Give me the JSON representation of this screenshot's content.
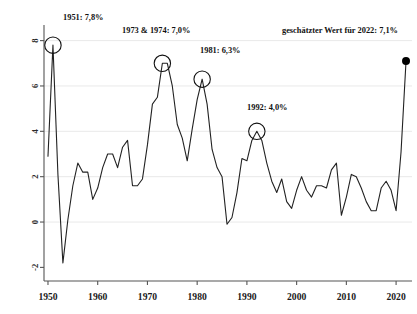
{
  "chart_data": {
    "type": "line",
    "title": "",
    "subtitle": "",
    "xlabel": "",
    "ylabel": "",
    "xlim": [
      1949.2,
      2023.2
    ],
    "ylim": [
      -2.6,
      8.6
    ],
    "xticks": [
      1950,
      1960,
      1970,
      1980,
      1990,
      2000,
      2010,
      2020
    ],
    "xtick_labels": [
      "1950",
      "1960",
      "1970",
      "1980",
      "1990",
      "2000",
      "2010",
      "2020"
    ],
    "yticks": [
      -2,
      0,
      2,
      4,
      6,
      8
    ],
    "ytick_labels": [
      "-2",
      "0",
      "2",
      "4",
      "6",
      "8"
    ],
    "grid": "horizontal",
    "legend": "none",
    "line_color": "#222222",
    "marker_color": "#000000",
    "grid_color": "#e9e9e9",
    "axis_color": "#555555",
    "series": [
      {
        "name": "Inflationsrate",
        "x": [
          1950,
          1951,
          1952,
          1953,
          1954,
          1955,
          1956,
          1957,
          1958,
          1959,
          1960,
          1961,
          1962,
          1963,
          1964,
          1965,
          1966,
          1967,
          1968,
          1969,
          1970,
          1971,
          1972,
          1973,
          1974,
          1975,
          1976,
          1977,
          1978,
          1979,
          1980,
          1981,
          1982,
          1983,
          1984,
          1985,
          1986,
          1987,
          1988,
          1989,
          1990,
          1991,
          1992,
          1993,
          1994,
          1995,
          1996,
          1997,
          1998,
          1999,
          2000,
          2001,
          2002,
          2003,
          2004,
          2005,
          2006,
          2007,
          2008,
          2009,
          2010,
          2011,
          2012,
          2013,
          2014,
          2015,
          2016,
          2017,
          2018,
          2019,
          2020,
          2021,
          2022
        ],
        "y": [
          2.9,
          7.8,
          2.1,
          -1.8,
          0.1,
          1.6,
          2.6,
          2.2,
          2.2,
          1.0,
          1.5,
          2.4,
          3.0,
          3.0,
          2.4,
          3.3,
          3.6,
          1.6,
          1.6,
          1.9,
          3.4,
          5.2,
          5.5,
          7.0,
          7.0,
          6.0,
          4.3,
          3.7,
          2.7,
          4.1,
          5.4,
          6.3,
          5.2,
          3.2,
          2.4,
          2.0,
          -0.1,
          0.2,
          1.3,
          2.8,
          2.7,
          3.6,
          4.0,
          3.6,
          2.6,
          1.8,
          1.3,
          1.9,
          0.9,
          0.6,
          1.4,
          2.0,
          1.4,
          1.1,
          1.6,
          1.6,
          1.5,
          2.3,
          2.6,
          0.3,
          1.1,
          2.1,
          2.0,
          1.5,
          0.9,
          0.5,
          0.5,
          1.5,
          1.8,
          1.4,
          0.5,
          3.1,
          7.1
        ]
      }
    ],
    "annotations": [
      {
        "id": "peak-1951",
        "label": "1951: 7,8%",
        "year": 1951,
        "value": 7.8,
        "marker": "circle-open",
        "text_x": 63,
        "text_y": 20,
        "anchor": "start"
      },
      {
        "id": "peak-1973-1974",
        "label": "1973 & 1974: 7,0%",
        "year": 1973,
        "value": 7.0,
        "marker": "circle-open",
        "text_x": 122,
        "text_y": 33,
        "anchor": "start"
      },
      {
        "id": "peak-1981",
        "label": "1981: 6,3%",
        "year": 1981,
        "value": 6.3,
        "marker": "circle-open",
        "text_x": 200,
        "text_y": 53,
        "anchor": "start"
      },
      {
        "id": "peak-1992",
        "label": "1992: 4,0%",
        "year": 1992,
        "value": 4.0,
        "marker": "circle-open",
        "text_x": 247,
        "text_y": 110,
        "anchor": "start"
      },
      {
        "id": "estimate-2022",
        "label": "geschätzter Wert für 2022: 7,1%",
        "year": 2022,
        "value": 7.1,
        "marker": "dot-filled",
        "text_x": 398,
        "text_y": 33,
        "anchor": "end"
      }
    ]
  }
}
